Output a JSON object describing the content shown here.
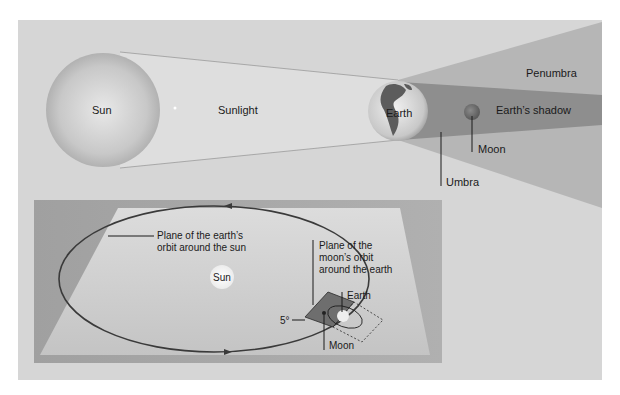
{
  "top_diagram": {
    "sun_label": "Sun",
    "sunlight_label": "Sunlight",
    "earth_label": "Earth",
    "penumbra_label": "Penumbra",
    "shadow_label": "Earth’s shadow",
    "moon_label": "Moon",
    "umbra_label": "Umbra"
  },
  "inset_diagram": {
    "earth_orbit_label_line1": "Plane of the earth’s",
    "earth_orbit_label_line2": "orbit around the sun",
    "sun_label": "Sun",
    "moon_orbit_label_line1": "Plane of the",
    "moon_orbit_label_line2": "moon’s orbit",
    "moon_orbit_label_line3": "around the earth",
    "earth_label": "Earth",
    "angle_label": "5°",
    "moon_label": "Moon"
  },
  "colors": {
    "outer_panel": "#d6d6d6",
    "inset_background": "#9c9c9c",
    "penumbra": "#b4b4b4",
    "umbra": "#8e8e8e",
    "orbit_line": "#3a3a3a",
    "text": "#1a1a1a"
  }
}
